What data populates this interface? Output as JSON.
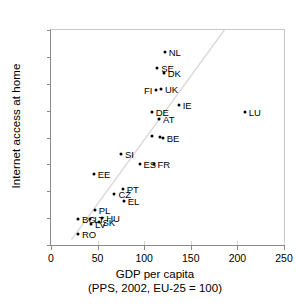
{
  "chart_data": {
    "type": "scatter",
    "title": "",
    "xlabel": "GDP per capita",
    "xlabel_line2": "(PPS, 2002, EU-25 = 100)",
    "ylabel": "Internet access at home",
    "xlim": [
      0,
      250
    ],
    "ylim": [
      0,
      80
    ],
    "xticks": [
      0,
      50,
      100,
      150,
      200,
      250
    ],
    "yticks": [
      0,
      10,
      20,
      30,
      40,
      50,
      60,
      70,
      80
    ],
    "grid": false,
    "legend": "none",
    "marker_color": "#000000",
    "trendline": {
      "visible": true,
      "color": "#d9d9d9",
      "x0": 22,
      "y0": 2,
      "x1": 186,
      "y1": 80
    },
    "points": [
      {
        "label": "NL",
        "x": 122,
        "y": 72.0,
        "label_pos": "right"
      },
      {
        "label": "SE",
        "x": 114,
        "y": 66.0,
        "label_pos": "right"
      },
      {
        "label": "DK",
        "x": 121,
        "y": 64.0,
        "label_pos": "right"
      },
      {
        "label": "FI",
        "x": 113,
        "y": 57.5,
        "label_pos": "left"
      },
      {
        "label": "UK",
        "x": 118,
        "y": 58.0,
        "label_pos": "right"
      },
      {
        "label": "IE",
        "x": 137,
        "y": 52.0,
        "label_pos": "right"
      },
      {
        "label": "LU",
        "x": 208,
        "y": 49.5,
        "label_pos": "right"
      },
      {
        "label": "DE",
        "x": 108,
        "y": 49.5,
        "label_pos": "right"
      },
      {
        "label": "AT",
        "x": 116,
        "y": 47.0,
        "label_pos": "right"
      },
      {
        "label": "",
        "x": 108,
        "y": 40.5,
        "label_pos": "right"
      },
      {
        "label": "",
        "x": 117,
        "y": 40.2,
        "label_pos": "right"
      },
      {
        "label": "BE",
        "x": 120,
        "y": 40.0,
        "label_pos": "right"
      },
      {
        "label": "SI",
        "x": 75,
        "y": 34.0,
        "label_pos": "right"
      },
      {
        "label": "ES",
        "x": 95,
        "y": 30.0,
        "label_pos": "right"
      },
      {
        "label": "FR",
        "x": 110,
        "y": 30.0,
        "label_pos": "right"
      },
      {
        "label": "EE",
        "x": 46,
        "y": 26.5,
        "label_pos": "right"
      },
      {
        "label": "PT",
        "x": 77,
        "y": 21.0,
        "label_pos": "right"
      },
      {
        "label": "CZ",
        "x": 68,
        "y": 19.0,
        "label_pos": "right"
      },
      {
        "label": "EL",
        "x": 78,
        "y": 16.5,
        "label_pos": "right"
      },
      {
        "label": "PL",
        "x": 47,
        "y": 13.0,
        "label_pos": "right"
      },
      {
        "label": "BG",
        "x": 29,
        "y": 9.5,
        "label_pos": "right"
      },
      {
        "label": "LT",
        "x": 42,
        "y": 9.5,
        "label_pos": "right"
      },
      {
        "label": "HU",
        "x": 55,
        "y": 10.0,
        "label_pos": "right"
      },
      {
        "label": "LV",
        "x": 43,
        "y": 8.0,
        "label_pos": "right"
      },
      {
        "label": "SK",
        "x": 51,
        "y": 8.5,
        "label_pos": "right"
      },
      {
        "label": "RO",
        "x": 29,
        "y": 4.0,
        "label_pos": "right"
      }
    ]
  }
}
